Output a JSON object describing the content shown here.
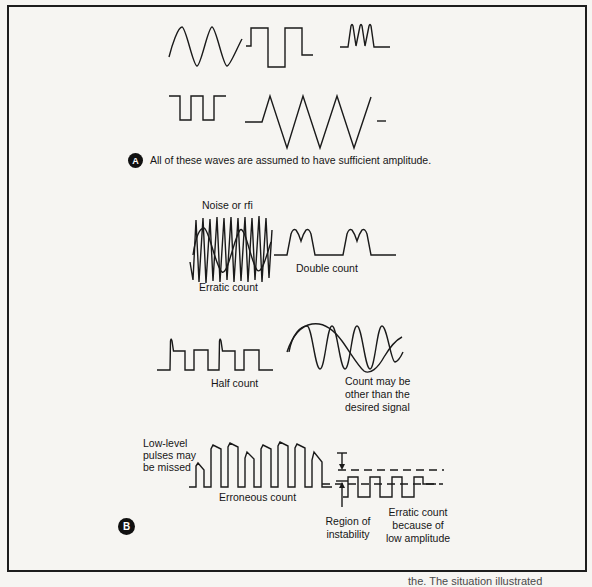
{
  "panel_a": {
    "marker": "A",
    "caption": "All of these waves are assumed to have sufficient amplitude."
  },
  "panel_b": {
    "marker": "B",
    "noise_label": "Noise or rfi",
    "erratic_label": "Erratic count",
    "double_count_label": "Double count",
    "half_count_label": "Half count",
    "other_signal_lines": [
      "Count may be",
      "other than the",
      "desired signal"
    ],
    "low_level_lines": [
      "Low-level",
      "pulses may",
      "be missed"
    ],
    "erroneous_label": "Erroneous count",
    "region_lines": [
      "Region of",
      "instability"
    ],
    "low_amp_lines": [
      "Erratic count",
      "because of",
      "low amplitude"
    ]
  },
  "caption_fragment": "the. The situation illustrated",
  "colors": {
    "ink": "#1a1a1a",
    "paper": "#f6f5f2"
  }
}
